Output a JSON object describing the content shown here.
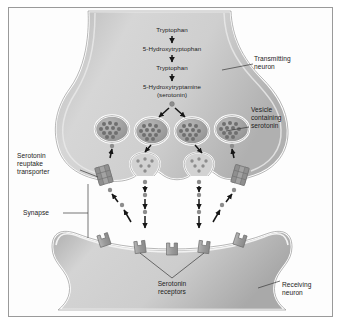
{
  "figure": {
    "border_color": "#9a9a9a",
    "background_color": "#ffffff",
    "neuron_fill": "#c9c9c9",
    "neuron_outline": "#ffffff",
    "ink_color": "#1c1c1c",
    "vesicle_fill": "#9e9e9e",
    "granule_color": "#6f6f6f",
    "serotonin_dot_color": "#8d8d8d",
    "receptor_fill": "#9b9b9b",
    "transporter_fill": "#a3a3a3"
  },
  "pathway": {
    "steps": [
      "Tryptophan",
      "5-Hydroxytryptophan",
      "Tryptophan",
      "5-Hydroxytryptamine\n(serotonin)"
    ]
  },
  "labels": {
    "transmitting_neuron": "Transmitting\nneuron",
    "vesicle": "Vesicle\ncontaining\nserotonin",
    "reuptake_transporter": "Serotonin\nreuptake\ntransporter",
    "synapse": "Synapse",
    "receptors": "Serotonin\nreceptors",
    "receiving_neuron": "Receiving\nneuron"
  },
  "structures": {
    "vesicle_count": 4,
    "fusing_vesicle_count": 2,
    "transporter_count": 2,
    "receptor_count": 5
  }
}
